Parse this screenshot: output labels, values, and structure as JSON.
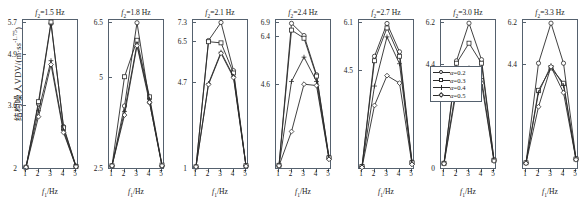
{
  "chart_data": {
    "type": "line",
    "title": "",
    "xlabel": "f1/Hz",
    "ylabel": "结构噪人VDV/(m·s^-1.75)",
    "ylabel_plain": "结构噪人VDV/(m·s",
    "ylabel_exp": "-1.75",
    "ylabel_tail": ")",
    "x": [
      1,
      2,
      3,
      4,
      5
    ],
    "xticks": [
      "1",
      "2",
      "3",
      "4",
      "5"
    ],
    "legend_position": "right-outside",
    "grid": false,
    "series_names": [
      "α=0.2",
      "α=0.3",
      "α=0.4",
      "α=0.5"
    ],
    "markers": [
      "circle",
      "square",
      "plus",
      "diamond"
    ],
    "panels": [
      {
        "title_var": "f",
        "title_sub": "2",
        "title_value": "=1.5 Hz",
        "title_full": "f2=1.5 Hz",
        "yticks": [
          "5.7",
          "4.9",
          "3.6",
          "2"
        ],
        "ytick_values": [
          5.7,
          4.9,
          3.6,
          2.0
        ],
        "ylim": [
          2.0,
          5.7
        ],
        "series": [
          {
            "name": "α=0.2",
            "values": [
              2.02,
              3.62,
              5.66,
              3.05,
              2.05
            ]
          },
          {
            "name": "α=0.3",
            "values": [
              2.02,
              3.68,
              5.7,
              3.02,
              2.04
            ]
          },
          {
            "name": "α=0.4",
            "values": [
              2.02,
              3.45,
              4.72,
              2.95,
              2.03
            ]
          },
          {
            "name": "α=0.5",
            "values": [
              2.02,
              3.3,
              4.62,
              2.9,
              2.03
            ]
          }
        ]
      },
      {
        "title_var": "f",
        "title_sub": "2",
        "title_value": "=1.8 Hz",
        "title_full": "f2=1.8 Hz",
        "yticks": [
          "6.5",
          "5",
          "2.5"
        ],
        "ytick_values": [
          6.5,
          5.0,
          2.5
        ],
        "ylim": [
          2.5,
          6.5
        ],
        "series": [
          {
            "name": "α=0.2",
            "values": [
              2.56,
              4.2,
              6.48,
              4.3,
              2.56
            ]
          },
          {
            "name": "α=0.3",
            "values": [
              2.56,
              5.0,
              6.0,
              4.45,
              2.58
            ]
          },
          {
            "name": "α=0.4",
            "values": [
              2.56,
              4.05,
              5.9,
              4.38,
              2.57
            ]
          },
          {
            "name": "α=0.5",
            "values": [
              2.56,
              3.95,
              5.85,
              4.3,
              2.56
            ]
          }
        ]
      },
      {
        "title_var": "f",
        "title_sub": "2",
        "title_value": "=2.1 Hz",
        "title_full": "f2=2.1 Hz",
        "yticks": [
          "7.3",
          "6.5",
          "4.7",
          "1"
        ],
        "ytick_values": [
          7.3,
          6.5,
          4.7,
          1.0
        ],
        "ylim": [
          1.0,
          7.3
        ],
        "series": [
          {
            "name": "α=0.2",
            "values": [
              1.05,
              6.5,
              7.28,
              5.2,
              1.1
            ]
          },
          {
            "name": "α=0.3",
            "values": [
              1.05,
              6.45,
              6.4,
              5.1,
              1.1
            ]
          },
          {
            "name": "α=0.4",
            "values": [
              1.05,
              4.65,
              6.0,
              4.95,
              1.08
            ]
          },
          {
            "name": "α=0.5",
            "values": [
              1.05,
              4.6,
              5.95,
              4.9,
              1.08
            ]
          }
        ]
      },
      {
        "title_var": "f",
        "title_sub": "2",
        "title_value": "=2.4 Hz",
        "title_full": "f2=2.4 Hz",
        "yticks": [
          "6.9",
          "6.4",
          "4.6"
        ],
        "ytick_values": [
          6.9,
          6.4,
          4.6
        ],
        "ylim": [
          1.5,
          6.9
        ],
        "series": [
          {
            "name": "α=0.2",
            "values": [
              1.6,
              6.85,
              6.4,
              4.95,
              1.9
            ]
          },
          {
            "name": "α=0.3",
            "values": [
              1.6,
              6.6,
              6.3,
              4.9,
              1.88
            ]
          },
          {
            "name": "α=0.4",
            "values": [
              1.58,
              4.7,
              5.6,
              4.7,
              1.85
            ]
          },
          {
            "name": "α=0.5",
            "values": [
              1.58,
              2.85,
              4.6,
              4.55,
              1.82
            ]
          }
        ]
      },
      {
        "title_var": "f",
        "title_sub": "2",
        "title_value": "=2.7 Hz",
        "title_full": "f2=2.7 Hz",
        "yticks": [
          "6.1",
          "4.5"
        ],
        "ytick_values": [
          6.1,
          4.5
        ],
        "ylim": [
          1.2,
          6.1
        ],
        "series": [
          {
            "name": "α=0.2",
            "values": [
              1.25,
              4.95,
              6.05,
              5.1,
              1.4
            ]
          },
          {
            "name": "α=0.3",
            "values": [
              1.25,
              4.8,
              5.9,
              4.95,
              1.38
            ]
          },
          {
            "name": "α=0.4",
            "values": [
              1.25,
              3.95,
              5.6,
              4.7,
              1.35
            ]
          },
          {
            "name": "α=0.5",
            "values": [
              1.22,
              3.3,
              4.3,
              4.05,
              1.32
            ]
          }
        ]
      },
      {
        "title_var": "f",
        "title_sub": "2",
        "title_value": "=3.0 Hz",
        "title_full": "f2=3.0 Hz",
        "yticks": [
          "6.2",
          "4.4",
          "0"
        ],
        "ytick_values": [
          6.2,
          4.4,
          0.0
        ],
        "ylim": [
          0.0,
          6.2
        ],
        "series": [
          {
            "name": "α=0.2",
            "values": [
              0.2,
              4.55,
              6.15,
              4.6,
              0.35
            ]
          },
          {
            "name": "α=0.3",
            "values": [
              0.2,
              4.45,
              5.3,
              4.45,
              0.33
            ]
          },
          {
            "name": "α=0.4",
            "values": [
              0.2,
              3.5,
              4.25,
              3.8,
              0.3
            ]
          },
          {
            "name": "α=0.5",
            "values": [
              0.18,
              3.3,
              4.1,
              3.6,
              0.3
            ]
          }
        ]
      },
      {
        "title_var": "f",
        "title_sub": "2",
        "title_value": "=3.3 Hz",
        "title_full": "f2=3.3 Hz",
        "yticks": [
          "6.2",
          "4.4"
        ],
        "ytick_values": [
          6.2,
          4.4
        ],
        "ylim": [
          0.0,
          6.2
        ],
        "series": [
          {
            "name": "α=0.2",
            "values": [
              0.22,
              4.45,
              6.15,
              4.45,
              0.4
            ]
          },
          {
            "name": "α=0.3",
            "values": [
              0.22,
              3.3,
              4.25,
              3.6,
              0.38
            ]
          },
          {
            "name": "α=0.4",
            "values": [
              0.22,
              3.2,
              4.35,
              3.5,
              0.36
            ]
          },
          {
            "name": "α=0.5",
            "values": [
              0.2,
              2.6,
              4.3,
              3.2,
              0.35
            ]
          }
        ]
      }
    ],
    "legend": [
      {
        "label": "α=0.2",
        "marker": "circle"
      },
      {
        "label": "α=0.3",
        "marker": "square"
      },
      {
        "label": "α=0.4",
        "marker": "plus"
      },
      {
        "label": "α=0.5",
        "marker": "diamond"
      }
    ]
  }
}
